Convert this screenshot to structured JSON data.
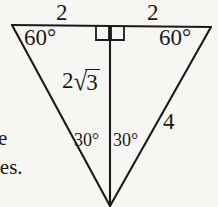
{
  "figure": {
    "caption_fragments": {
      "line1": "e",
      "line2": "les."
    },
    "colors": {
      "background": "#f7f6f3",
      "stroke": "#1a1a1a",
      "text": "#1a1a1a"
    },
    "labels": {
      "top_left_length": "2",
      "top_right_length": "2",
      "base_angle_left": "60°",
      "base_angle_right": "60°",
      "apex_angle_left": "30°",
      "apex_angle_right": "30°",
      "altitude_coefficient": "2",
      "altitude_surd": "√",
      "altitude_radicand": "3",
      "altitude_full": "2√3",
      "right_side_length": "4"
    },
    "markers": {
      "right_angle_left": "right-angle-square",
      "right_angle_right": "right-angle-square"
    },
    "geometry": {
      "top_left_vertex": [
        12,
        25
      ],
      "top_right_vertex": [
        211,
        27
      ],
      "apex_vertex": [
        110,
        206
      ],
      "altitude_foot": [
        110,
        26
      ],
      "top_edge_left_length": "2",
      "top_edge_right_length": "2",
      "altitude_length": "2√3",
      "right_side_length": "4",
      "shape": "isosceles-triangle-with-altitude"
    }
  }
}
